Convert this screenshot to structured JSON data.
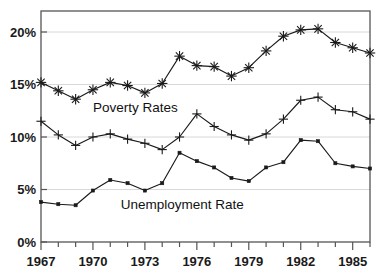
{
  "chart_data": {
    "type": "line",
    "title": "",
    "subtitle": "",
    "xlabel": "",
    "ylabel": "",
    "xlim": [
      1967,
      1986
    ],
    "ylim": [
      0,
      22
    ],
    "grid": true,
    "grid_axis": "y",
    "legend": "inline-annotations",
    "y_ticks": [
      0,
      5,
      10,
      15,
      20
    ],
    "y_tick_labels": [
      "0%",
      "5%",
      "10%",
      "15%",
      "20%"
    ],
    "x_ticks": [
      1967,
      1968,
      1969,
      1970,
      1971,
      1972,
      1973,
      1974,
      1975,
      1976,
      1977,
      1978,
      1979,
      1980,
      1981,
      1982,
      1983,
      1984,
      1985,
      1986
    ],
    "x_tick_labels_shown": [
      "1967",
      "1970",
      "1973",
      "1976",
      "1979",
      "1982",
      "1985"
    ],
    "x_labeled_years": [
      1967,
      1970,
      1973,
      1976,
      1979,
      1982,
      1985
    ],
    "x": [
      1967,
      1968,
      1969,
      1970,
      1971,
      1972,
      1973,
      1974,
      1975,
      1976,
      1977,
      1978,
      1979,
      1980,
      1981,
      1982,
      1983,
      1984,
      1985,
      1986
    ],
    "series": [
      {
        "name": "Poverty Rates",
        "marker": "asterisk",
        "color": "#1a1a1a",
        "annotation": "Poverty Rates",
        "values": [
          15.2,
          14.4,
          13.6,
          14.5,
          15.2,
          14.9,
          14.2,
          15.1,
          17.7,
          16.8,
          16.7,
          15.8,
          16.6,
          18.2,
          19.6,
          20.2,
          20.3,
          19.0,
          18.5,
          18.0
        ]
      },
      {
        "name": "Middle series",
        "marker": "plus",
        "color": "#1a1a1a",
        "annotation": "",
        "values": [
          11.5,
          10.2,
          9.2,
          10.0,
          10.3,
          9.8,
          9.4,
          8.8,
          10.0,
          12.2,
          11.0,
          10.2,
          9.7,
          10.3,
          11.7,
          13.5,
          13.8,
          12.6,
          12.4,
          11.7
        ]
      },
      {
        "name": "Unemployment Rate",
        "marker": "square",
        "color": "#1a1a1a",
        "annotation": "Unemployment Rate",
        "values": [
          3.8,
          3.6,
          3.5,
          4.9,
          5.9,
          5.6,
          4.9,
          5.6,
          8.5,
          7.7,
          7.1,
          6.1,
          5.8,
          7.1,
          7.6,
          9.7,
          9.6,
          7.5,
          7.2,
          7.0
        ]
      }
    ],
    "annotations": [
      {
        "text": "Poverty Rates",
        "year": 1970.0,
        "value": 12.4
      },
      {
        "text": "Unemployment Rate",
        "year": 1971.6,
        "value": 3.1
      }
    ]
  },
  "axis": {
    "y_label_0": "0%",
    "y_label_5": "5%",
    "y_label_10": "10%",
    "y_label_15": "15%",
    "y_label_20": "20%",
    "x_label_1967": "1967",
    "x_label_1970": "1970",
    "x_label_1973": "1973",
    "x_label_1976": "1976",
    "x_label_1979": "1979",
    "x_label_1982": "1982",
    "x_label_1985": "1985"
  },
  "annotations": {
    "poverty": "Poverty Rates",
    "unemployment": "Unemployment Rate"
  },
  "colors": {
    "line": "#1a1a1a",
    "grid": "#d8d8d8",
    "frame": "#555555",
    "background": "#ffffff"
  }
}
